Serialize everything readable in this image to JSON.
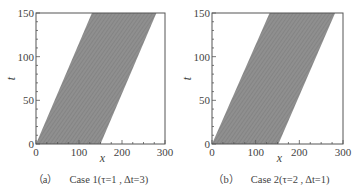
{
  "chart_data": [
    {
      "type": "area",
      "id": "a",
      "title": "",
      "caption_tag": "（a）",
      "caption": "Case 1(τ=1 , Δt=3)",
      "xlabel": "x",
      "ylabel": "t",
      "xlim": [
        0,
        300
      ],
      "ylim": [
        0,
        150
      ],
      "xticks": [
        0,
        100,
        200,
        300
      ],
      "yticks": [
        0,
        50,
        100,
        150
      ],
      "x_minor_step": 25,
      "y_minor_step": 10,
      "grid": false,
      "band": {
        "description": "shaded space-time trajectory band of vehicles",
        "polygon": [
          [
            0,
            0
          ],
          [
            150,
            0
          ],
          [
            280,
            150
          ],
          [
            130,
            150
          ]
        ],
        "fill": "#8f8f8f"
      }
    },
    {
      "type": "area",
      "id": "b",
      "title": "",
      "caption_tag": "（b）",
      "caption": "Case 2(τ=2 , Δt=1)",
      "xlabel": "x",
      "ylabel": "t",
      "xlim": [
        0,
        300
      ],
      "ylim": [
        0,
        150
      ],
      "xticks": [
        0,
        100,
        200,
        300
      ],
      "yticks": [
        0,
        50,
        100,
        150
      ],
      "x_minor_step": 25,
      "y_minor_step": 10,
      "grid": false,
      "band": {
        "description": "shaded space-time trajectory band of vehicles",
        "polygon": [
          [
            0,
            0
          ],
          [
            152,
            0
          ],
          [
            282,
            150
          ],
          [
            132,
            150
          ]
        ],
        "fill": "#8f8f8f"
      }
    }
  ],
  "panels": {
    "a": {
      "caption_tag": "（a）",
      "caption": "Case 1(τ=1 , Δt=3)"
    },
    "b": {
      "caption_tag": "（b）",
      "caption": "Case 2(τ=2 , Δt=1)"
    }
  },
  "colors": {
    "band": "#8f8f8f",
    "axis": "#555555",
    "text": "#444444"
  }
}
